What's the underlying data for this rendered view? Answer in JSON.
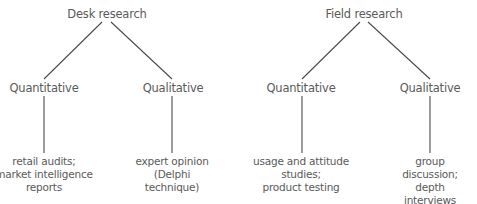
{
  "diagram": {
    "type": "tree",
    "trees": [
      {
        "root": "Desk research",
        "branches": [
          {
            "label": "Quantitative",
            "example": "retail audits;\nmarket intelligence\nreports"
          },
          {
            "label": "Qualitative",
            "example": "expert opinion\n(Delphi\ntechnique)"
          }
        ]
      },
      {
        "root": "Field research",
        "branches": [
          {
            "label": "Quantitative",
            "example": "usage and attitude\nstudies;\nproduct testing"
          },
          {
            "label": "Qualitative",
            "example": "group discussion;\ndepth interviews"
          }
        ]
      }
    ],
    "line_color": "#4a4a4a",
    "text_color": "#5a5a5a"
  }
}
